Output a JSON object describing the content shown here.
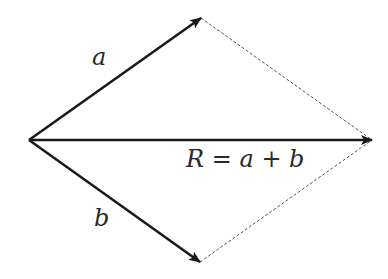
{
  "diagram": {
    "type": "vector-addition-parallelogram",
    "colors": {
      "vector": "#1a1a1a",
      "dashed": "#555555",
      "text": "#2a2a2a"
    },
    "vectors": [
      {
        "id": "a",
        "label": "a",
        "from": [
          29,
          140
        ],
        "to": [
          201,
          18
        ]
      },
      {
        "id": "b",
        "label": "b",
        "from": [
          29,
          140
        ],
        "to": [
          200,
          262
        ]
      },
      {
        "id": "R",
        "label": "R = a + b",
        "from": [
          29,
          140
        ],
        "to": [
          372,
          140
        ]
      }
    ],
    "dashed_edges": [
      {
        "from": [
          201,
          18
        ],
        "to": [
          372,
          140
        ]
      },
      {
        "from": [
          200,
          262
        ],
        "to": [
          372,
          140
        ]
      }
    ],
    "labels": {
      "a": "a",
      "b": "b",
      "resultant": "R = a + b"
    }
  }
}
